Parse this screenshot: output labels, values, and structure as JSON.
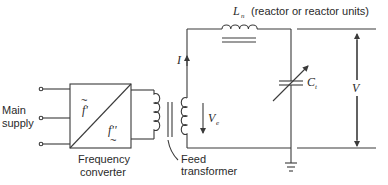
{
  "diagram": {
    "type": "circuit-schematic",
    "labels": {
      "main_supply_line1": "Main",
      "main_supply_line2": "supply",
      "converter_line1": "Frequency",
      "converter_line2": "converter",
      "converter_f_in": "f'",
      "converter_f_out": "f''",
      "converter_tilde": "~",
      "feed_line1": "Feed",
      "feed_line2": "transformer",
      "current": "I",
      "excitation_voltage": "V",
      "excitation_voltage_sub": "e",
      "inductor": "L",
      "inductor_sub": "n",
      "inductor_note": "(reactor or reactor units)",
      "capacitor": "C",
      "capacitor_sub": "t",
      "output_voltage": "V"
    },
    "components": [
      {
        "id": "main-supply",
        "kind": "three-phase terminals"
      },
      {
        "id": "frequency-converter",
        "kind": "converter block f' to f''"
      },
      {
        "id": "feed-transformer",
        "kind": "transformer with iron core"
      },
      {
        "id": "reactor",
        "kind": "inductor with iron core",
        "label": "Ln"
      },
      {
        "id": "test-capacitor",
        "kind": "variable capacitor",
        "label": "Ct"
      },
      {
        "id": "ground",
        "kind": "earth symbol"
      }
    ],
    "colors": {
      "line": "#3a3a3a",
      "text": "#2a2a2a",
      "background": "#ffffff"
    }
  }
}
